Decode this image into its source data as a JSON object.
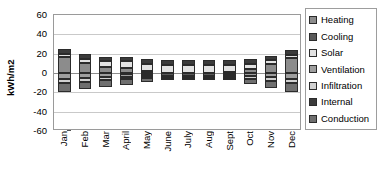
{
  "chart_data": {
    "type": "bar",
    "title": "",
    "xlabel": "",
    "ylabel": "kWh/m2",
    "ylim": [
      -60,
      60
    ],
    "yticks": [
      60,
      40,
      20,
      0,
      -20,
      -40,
      -60
    ],
    "grid": true,
    "stacked": true,
    "legend_position": "right",
    "categories": [
      "Jan",
      "Feb",
      "Mar",
      "April",
      "May",
      "June",
      "July",
      "Aug",
      "Sept",
      "Oct",
      "Nov",
      "Dec"
    ],
    "series": [
      {
        "name": "Heating",
        "color": "#8c8c8c",
        "values": [
          16.5,
          10.0,
          6.0,
          5.0,
          2.0,
          0.5,
          0.3,
          0.5,
          1.5,
          4.0,
          9.5,
          15.5
        ]
      },
      {
        "name": "Cooling",
        "color": "#5a5a5a",
        "values": [
          0.0,
          0.0,
          -0.5,
          -1.0,
          -2.0,
          -3.0,
          -3.5,
          -3.0,
          -2.0,
          -0.5,
          0.0,
          0.0
        ]
      },
      {
        "name": "Solar",
        "color": "#e2e2e2",
        "values": [
          3.0,
          4.5,
          6.0,
          7.0,
          7.5,
          8.0,
          8.0,
          7.5,
          6.5,
          5.0,
          3.5,
          3.0
        ]
      },
      {
        "name": "Ventilation",
        "color": "#9e9e9e",
        "values": [
          -6.0,
          -5.0,
          -4.0,
          -3.0,
          -2.0,
          -1.0,
          -0.8,
          -1.0,
          -1.5,
          -3.0,
          -4.5,
          -6.0
        ]
      },
      {
        "name": "Infiltration",
        "color": "#d0d0d0",
        "values": [
          -4.5,
          -4.0,
          -3.0,
          -2.5,
          -1.5,
          -0.8,
          -0.5,
          -0.8,
          -1.2,
          -2.5,
          -3.5,
          -4.5
        ]
      },
      {
        "name": "Internal",
        "color": "#3b3b3b",
        "values": [
          5.0,
          5.0,
          5.0,
          5.0,
          5.0,
          5.0,
          5.0,
          5.0,
          5.0,
          5.0,
          5.0,
          5.0
        ]
      },
      {
        "name": "Conduction",
        "color": "#6f6f6f",
        "values": [
          -9.5,
          -8.0,
          -6.5,
          -5.5,
          -3.5,
          -2.0,
          -1.5,
          -2.0,
          -3.0,
          -5.0,
          -7.5,
          -9.5
        ]
      }
    ]
  },
  "legend": {
    "items": [
      {
        "label": "Heating"
      },
      {
        "label": "Cooling"
      },
      {
        "label": "Solar"
      },
      {
        "label": "Ventilation"
      },
      {
        "label": "Infiltration"
      },
      {
        "label": "Internal"
      },
      {
        "label": "Conduction"
      }
    ]
  }
}
